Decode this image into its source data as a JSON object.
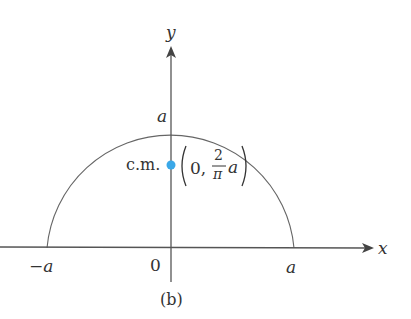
{
  "figure": {
    "caption": "(b)",
    "axes": {
      "x_label": "x",
      "y_label": "y",
      "origin_label": "0",
      "neg_a_label": "−a",
      "pos_a_label": "a",
      "top_a_label": "a"
    },
    "shape": "semicircle of radius a centered at origin",
    "center_of_mass": {
      "label": "c.m.",
      "coord_open": "(0,",
      "frac_num": "2",
      "frac_den": "π",
      "frac_var": "a",
      "coord_close": ")",
      "color": "#3aa8e8"
    },
    "colors": {
      "line": "#555555",
      "text": "#333333"
    }
  }
}
